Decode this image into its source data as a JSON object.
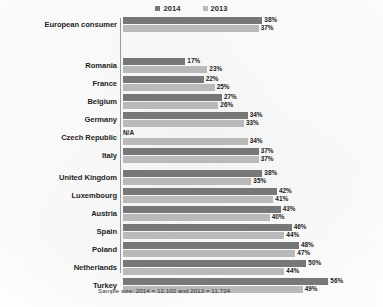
{
  "chart_data": {
    "type": "bar",
    "orientation": "horizontal",
    "title": "",
    "subtitle": "",
    "xlabel": "",
    "ylabel": "",
    "xlim": [
      0,
      60
    ],
    "grid": false,
    "legend_position": "top-center",
    "value_suffix": "%",
    "categories": [
      "European consumer",
      "Romania",
      "France",
      "Belgium",
      "Germany",
      "Czech Republic",
      "Italy",
      "United Kingdom",
      "Luxembourg",
      "Austria",
      "Spain",
      "Poland",
      "Netherlands",
      "Turkey"
    ],
    "series": [
      {
        "name": "2014",
        "color": "#777777",
        "values": [
          38,
          17,
          22,
          27,
          34,
          null,
          37,
          38,
          42,
          43,
          46,
          48,
          50,
          56
        ],
        "labels": [
          "38%",
          "17%",
          "22%",
          "27%",
          "34%",
          "N/A",
          "37%",
          "38%",
          "42%",
          "43%",
          "46%",
          "48%",
          "50%",
          "56%"
        ]
      },
      {
        "name": "2013",
        "color": "#b9b9b9",
        "values": [
          37,
          23,
          25,
          26,
          33,
          34,
          37,
          35,
          41,
          40,
          44,
          47,
          44,
          49
        ],
        "labels": [
          "37%",
          "23%",
          "25%",
          "26%",
          "33%",
          "34%",
          "37%",
          "35%",
          "41%",
          "40%",
          "44%",
          "47%",
          "44%",
          "49%"
        ]
      }
    ],
    "annotations": {
      "footnote": "Sample size: 2014 = 12,102 and 2013 = 11,724",
      "na_text": "N/A"
    }
  }
}
